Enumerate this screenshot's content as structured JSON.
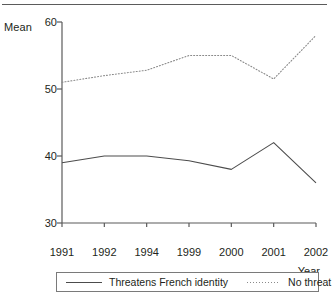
{
  "figure": {
    "y_axis_title": "Mean",
    "x_axis_title": "Year"
  },
  "legend": {
    "entries": [
      {
        "label": "Threatens French identity",
        "style": "solid",
        "swatch": "legend-line-solid-icon"
      },
      {
        "label": "No threat",
        "style": "dotted",
        "swatch": "legend-line-dotted-icon"
      }
    ]
  },
  "chart_data": {
    "type": "line",
    "title": "",
    "xlabel": "Year",
    "ylabel": "Mean",
    "categories": [
      "1991",
      "1992",
      "1994",
      "1999",
      "2000",
      "2001",
      "2002"
    ],
    "series": [
      {
        "name": "Threatens French identity",
        "style": "solid",
        "color": "#4c4c4c",
        "values": [
          39.0,
          40.0,
          40.0,
          39.3,
          38.0,
          42.0,
          36.0
        ]
      },
      {
        "name": "No threat",
        "style": "dotted",
        "color": "#8a8a8a",
        "values": [
          51.0,
          52.0,
          52.8,
          55.0,
          55.0,
          51.5,
          58.0
        ]
      }
    ],
    "ylim": [
      30,
      60
    ],
    "yticks": [
      30,
      40,
      50,
      60
    ],
    "ytick_labels": [
      "30",
      "40",
      "50",
      "60"
    ],
    "grid": false,
    "legend_position": "bottom"
  }
}
